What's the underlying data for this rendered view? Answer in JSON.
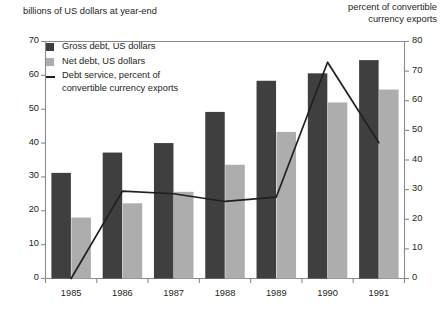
{
  "captions": {
    "left": "billions of US dollars at year-end",
    "right": "percent of convertible\ncurrency exports"
  },
  "legend": {
    "gross_label": "Gross debt, US dollars",
    "net_label": "Net debt, US dollars",
    "line_label": "Debt service, percent of\nconvertible currency exports"
  },
  "colors": {
    "gross": "#3f3f3f",
    "net": "#adadad",
    "line": "#231f20",
    "axis": "#8a8a8a",
    "text": "#231f20",
    "background": "#ffffff"
  },
  "chart_data": {
    "type": "bar",
    "title": "",
    "xlabel": "",
    "ylabel": "billions of US dollars at year-end",
    "y2label": "percent of convertible currency exports",
    "categories": [
      "1985",
      "1986",
      "1987",
      "1988",
      "1989",
      "1990",
      "1991"
    ],
    "ylim": [
      0,
      70
    ],
    "yticks": [
      0,
      10,
      20,
      30,
      40,
      50,
      60,
      70
    ],
    "y2lim": [
      0,
      80
    ],
    "y2ticks": [
      0,
      10,
      20,
      30,
      40,
      50,
      60,
      70,
      80
    ],
    "grid": false,
    "legend_position": "upper-left-inside",
    "series": [
      {
        "name": "Gross debt, US dollars",
        "type": "bar",
        "axis": "left",
        "color": "#3f3f3f",
        "values": [
          31.2,
          37.2,
          40.0,
          49.2,
          58.4,
          60.6,
          64.5
        ]
      },
      {
        "name": "Net debt, US dollars",
        "type": "bar",
        "axis": "left",
        "color": "#adadad",
        "values": [
          18.0,
          22.2,
          25.6,
          33.6,
          43.3,
          52.0,
          55.8
        ]
      },
      {
        "name": "Debt service, percent of convertible currency exports",
        "type": "line",
        "axis": "right",
        "color": "#231f20",
        "values": [
          0.0,
          29.5,
          28.6,
          26.0,
          27.5,
          73.0,
          45.8
        ]
      }
    ]
  }
}
